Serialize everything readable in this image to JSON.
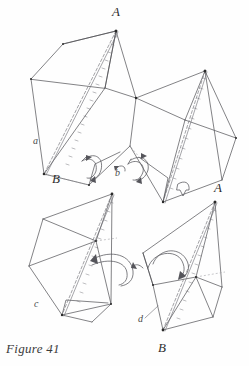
{
  "figure": {
    "caption": "Figure 41",
    "panels": [
      {
        "id": "a",
        "part_label": "a",
        "vertex_labels": [
          "A",
          "B"
        ],
        "description": "upper-left folded form with apex A and lower vertex B"
      },
      {
        "id": "b",
        "part_label": "b",
        "vertex_labels": [],
        "description": "upper-right mirrored folded form"
      },
      {
        "id": "c",
        "part_label": "c",
        "vertex_labels": [],
        "description": "lower-left folded form"
      },
      {
        "id": "d",
        "part_label": "d",
        "vertex_labels": [
          "A",
          "B"
        ],
        "description": "lower-right folded form with apex A and base vertex B"
      }
    ],
    "labels": {
      "a_top": "A",
      "a_part": "a",
      "a_bottom": "B",
      "b_part": "b",
      "c_part": "c",
      "d_part": "d",
      "d_top": "A",
      "d_bottom": "B"
    },
    "colors": {
      "background": "#fefefe",
      "ink": "#4d4d52",
      "label_ink": "#3a3a3a",
      "arrow_ink": "#55555b",
      "dash_ink": "#7a7a80"
    }
  }
}
